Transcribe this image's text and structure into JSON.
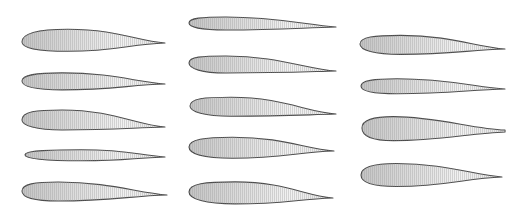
{
  "figure": {
    "colors": {
      "background": "#ffffff",
      "fill_light": "#f4f4f4",
      "fill_dark": "#c9c9c9",
      "outline": "#4a4a4a"
    },
    "columns": [
      {
        "name": "left",
        "airfoils": [
          {
            "id": "L1",
            "le": [
              22,
              42
            ],
            "te": [
              165,
              43
            ],
            "top": 13,
            "bottom": 9,
            "tmax_at": 0.32,
            "camber": "moderate"
          },
          {
            "id": "L2",
            "le": [
              22,
              81
            ],
            "te": [
              165,
              84
            ],
            "top": 9,
            "bottom": 8,
            "tmax_at": 0.28,
            "camber": "slight"
          },
          {
            "id": "L3",
            "le": [
              22,
              120
            ],
            "te": [
              165,
              127
            ],
            "top": 12,
            "bottom": 8,
            "tmax_at": 0.28,
            "camber": "moderate"
          },
          {
            "id": "L4",
            "le": [
              25,
              155
            ],
            "te": [
              165,
              157
            ],
            "top": 6,
            "bottom": 5,
            "tmax_at": 0.4,
            "camber": "thin-symmetric"
          },
          {
            "id": "L5",
            "le": [
              22,
              191
            ],
            "te": [
              167,
              195
            ],
            "top": 10,
            "bottom": 9,
            "tmax_at": 0.25,
            "camber": "slight"
          }
        ]
      },
      {
        "name": "middle",
        "airfoils": [
          {
            "id": "M1",
            "le": [
              189,
              23
            ],
            "te": [
              336,
              27
            ],
            "top": 7,
            "bottom": 6,
            "tmax_at": 0.25,
            "camber": "reflexed"
          },
          {
            "id": "M2",
            "le": [
              189,
              63
            ],
            "te": [
              336,
              71
            ],
            "top": 9,
            "bottom": 8,
            "tmax_at": 0.25,
            "camber": "slight"
          },
          {
            "id": "M3",
            "le": [
              190,
              106
            ],
            "te": [
              336,
              114
            ],
            "top": 11,
            "bottom": 8,
            "tmax_at": 0.28,
            "camber": "high"
          },
          {
            "id": "M4",
            "le": [
              189,
              147
            ],
            "te": [
              334,
              151
            ],
            "top": 11,
            "bottom": 10,
            "tmax_at": 0.3,
            "camber": "slight"
          },
          {
            "id": "M5",
            "le": [
              189,
              192
            ],
            "te": [
              333,
              198
            ],
            "top": 12,
            "bottom": 10,
            "tmax_at": 0.32,
            "camber": "moderate"
          }
        ]
      },
      {
        "name": "right",
        "airfoils": [
          {
            "id": "R1",
            "le": [
              360,
              44
            ],
            "te": [
              505,
              49
            ],
            "top": 10,
            "bottom": 9,
            "tmax_at": 0.28,
            "camber": "slight"
          },
          {
            "id": "R2",
            "le": [
              361,
              86
            ],
            "te": [
              505,
              89
            ],
            "top": 8,
            "bottom": 7,
            "tmax_at": 0.25,
            "camber": "slight"
          },
          {
            "id": "R3",
            "le": [
              362,
              128
            ],
            "te": [
              505,
              131
            ],
            "top": 12,
            "bottom": 12,
            "tmax_at": 0.22,
            "camber": "low, cusped tail"
          },
          {
            "id": "R4",
            "le": [
              361,
              175
            ],
            "te": [
              502,
              177
            ],
            "top": 12,
            "bottom": 11,
            "tmax_at": 0.25,
            "camber": "symmetric-thick"
          }
        ]
      }
    ]
  }
}
